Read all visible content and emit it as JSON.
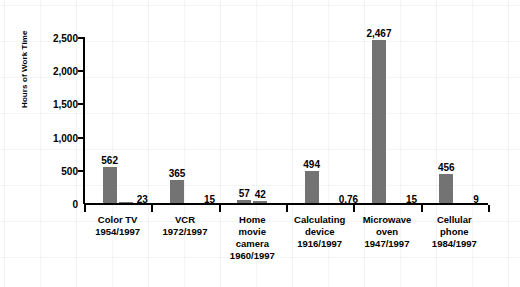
{
  "chart_data": {
    "type": "bar",
    "title": "",
    "subtitle": "",
    "xlabel": "",
    "ylabel": "Hours of Work Time",
    "ylim": [
      0,
      2500
    ],
    "yticks": [
      0,
      500,
      1000,
      1500,
      2000,
      2500
    ],
    "ytick_labels": [
      "0",
      "500",
      "1,000",
      "1,500",
      "2,000",
      "2,500"
    ],
    "grid": true,
    "legend": "none",
    "categories": [
      "Color TV\n1954/1997",
      "VCR\n1972/1997",
      "Home\nmovie\ncamera\n1960/1997",
      "Calculating\ndevice\n1916/1997",
      "Microwave\noven\n1947/1997",
      "Cellular\nphone\n1984/1997"
    ],
    "series": [
      {
        "name": "Introduction year",
        "values": [
          562,
          365,
          57,
          494,
          2467,
          456
        ],
        "labels": [
          "562",
          "365",
          "57",
          "494",
          "2,467",
          "456"
        ]
      },
      {
        "name": "1997",
        "values": [
          23,
          15,
          42,
          0.76,
          15,
          9
        ],
        "labels": [
          "23",
          "15",
          "42",
          "0.76",
          "15",
          "9"
        ]
      }
    ],
    "bar_color": "#737373",
    "axis_color": "#000000",
    "background_color": "#ffffff",
    "grid_color": "#c8cdd7"
  },
  "groups": [
    {
      "name": "color-tv",
      "label": "Color TV\n1954/1997",
      "bars": [
        {
          "name": "color-tv-1954",
          "value": 562,
          "label": "562",
          "label_pos": "top"
        },
        {
          "name": "color-tv-1997",
          "value": 23,
          "label": "23",
          "label_pos": "side"
        }
      ]
    },
    {
      "name": "vcr",
      "label": "VCR\n1972/1997",
      "bars": [
        {
          "name": "vcr-1972",
          "value": 365,
          "label": "365",
          "label_pos": "top"
        },
        {
          "name": "vcr-1997",
          "value": 15,
          "label": "15",
          "label_pos": "side"
        }
      ]
    },
    {
      "name": "home-movie-camera",
      "label": "Home\nmovie\ncamera\n1960/1997",
      "bars": [
        {
          "name": "home-movie-camera-1960",
          "value": 57,
          "label": "57",
          "label_pos": "top"
        },
        {
          "name": "home-movie-camera-1997",
          "value": 42,
          "label": "42",
          "label_pos": "top"
        }
      ]
    },
    {
      "name": "calculating-device",
      "label": "Calculating\ndevice\n1916/1997",
      "bars": [
        {
          "name": "calculating-device-1916",
          "value": 494,
          "label": "494",
          "label_pos": "top"
        },
        {
          "name": "calculating-device-1997",
          "value": 0.76,
          "label": "0.76",
          "label_pos": "side"
        }
      ]
    },
    {
      "name": "microwave-oven",
      "label": "Microwave\noven\n1947/1997",
      "bars": [
        {
          "name": "microwave-oven-1947",
          "value": 2467,
          "label": "2,467",
          "label_pos": "top"
        },
        {
          "name": "microwave-oven-1997",
          "value": 15,
          "label": "15",
          "label_pos": "side"
        }
      ]
    },
    {
      "name": "cellular-phone",
      "label": "Cellular\nphone\n1984/1997",
      "bars": [
        {
          "name": "cellular-phone-1984",
          "value": 456,
          "label": "456",
          "label_pos": "top"
        },
        {
          "name": "cellular-phone-1997",
          "value": 9,
          "label": "9",
          "label_pos": "side"
        }
      ]
    }
  ]
}
